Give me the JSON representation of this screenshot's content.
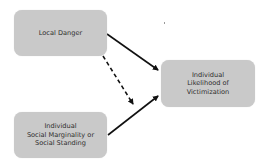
{
  "diagram": {
    "nodes": [
      {
        "id": "local_danger",
        "lines": [
          "Local Danger"
        ]
      },
      {
        "id": "social_marginality",
        "lines": [
          "Individual",
          "Social Marginality or",
          "Social Standing"
        ]
      },
      {
        "id": "victimization",
        "lines": [
          "Individual",
          "Likelihood of",
          "Victimization"
        ]
      }
    ],
    "edges": [
      {
        "from": "local_danger",
        "to": "victimization",
        "style": "solid"
      },
      {
        "from": "social_marginality",
        "to": "victimization",
        "style": "solid"
      },
      {
        "from": "local_danger",
        "to": "social_marginality_to_victimization_edge",
        "style": "dashed"
      }
    ],
    "colors": {
      "node_fill": "#c9c9c9",
      "node_text": "#2e2e2e",
      "edge": "#111111"
    }
  }
}
